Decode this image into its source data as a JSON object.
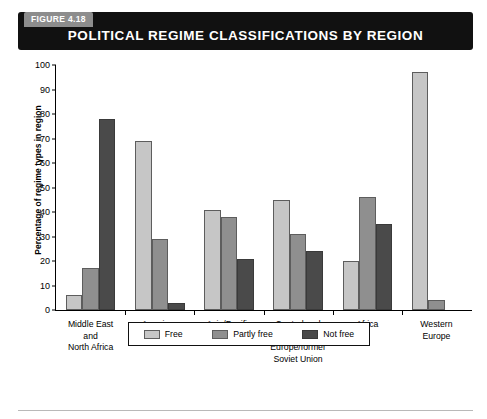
{
  "figure": {
    "tag": "FIGURE 4.18",
    "title": "POLITICAL REGIME CLASSIFICATIONS BY REGION"
  },
  "legend": {
    "items": [
      {
        "label": "Free",
        "color": "#c6c6c6",
        "key": "free"
      },
      {
        "label": "Partly free",
        "color": "#8f8f8f",
        "key": "partly"
      },
      {
        "label": "Not free",
        "color": "#4a4a4a",
        "key": "notfree"
      }
    ]
  },
  "chart_data": {
    "type": "bar",
    "title": "POLITICAL REGIME CLASSIFICATIONS BY REGION",
    "xlabel": "",
    "ylabel": "Percentage of regime types in region",
    "ylim": [
      0,
      100
    ],
    "ytick_labels": [
      "0",
      "10",
      "20",
      "30",
      "40",
      "50",
      "60",
      "70",
      "80",
      "90",
      "100"
    ],
    "ytick_values": [
      0,
      10,
      20,
      30,
      40,
      50,
      60,
      70,
      80,
      90,
      100
    ],
    "grid": false,
    "legend_position": "bottom",
    "categories": [
      "Middle East and North Africa",
      "Americas",
      "Asia/Pacific",
      "Central and Eastern Europe/former Soviet Union",
      "Africa",
      "Western Europe"
    ],
    "category_label_lines": [
      [
        "Middle East",
        "and",
        "North Africa"
      ],
      [
        "Americas"
      ],
      [
        "Asia/Pacific"
      ],
      [
        "Central and",
        "Eastern",
        "Europe/former",
        "Soviet Union"
      ],
      [
        "Africa"
      ],
      [
        "Western",
        "Europe"
      ]
    ],
    "series": [
      {
        "name": "Free",
        "color": "#c6c6c6",
        "values": [
          6,
          69,
          41,
          45,
          20,
          97
        ]
      },
      {
        "name": "Partly free",
        "color": "#8f8f8f",
        "values": [
          17,
          29,
          38,
          31,
          46,
          4
        ]
      },
      {
        "name": "Not free",
        "color": "#4a4a4a",
        "values": [
          78,
          3,
          21,
          24,
          35,
          0
        ]
      }
    ]
  }
}
